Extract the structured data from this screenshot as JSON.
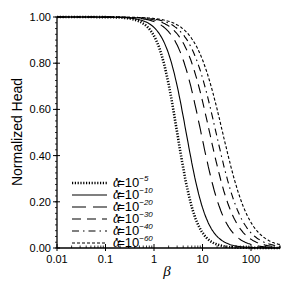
{
  "chart_data": {
    "type": "line",
    "title": "",
    "xlabel": "β",
    "ylabel": "Normalized Head",
    "xscale": "log",
    "xlim": [
      0.01,
      400
    ],
    "ylim": [
      0.0,
      1.0
    ],
    "x_ticks": [
      "0.01",
      "0.1",
      "1",
      "10",
      "100"
    ],
    "y_ticks": [
      "0.00",
      "0.20",
      "0.40",
      "0.60",
      "0.80",
      "1.00"
    ],
    "grid": false,
    "legend_position": "lower left",
    "series": [
      {
        "name": "α*=10^-5",
        "legend_base": "α",
        "legend_eq": "=10",
        "legend_exp": "−5",
        "style": "dotted-thick",
        "beta_half": 3.0
      },
      {
        "name": "α*=10^-10",
        "legend_base": "α",
        "legend_eq": "=10",
        "legend_exp": "−10",
        "style": "solid",
        "beta_half": 4.6
      },
      {
        "name": "α*=10^-20",
        "legend_base": "α",
        "legend_eq": "=10",
        "legend_exp": "−20",
        "style": "long-dash",
        "beta_half": 9.3
      },
      {
        "name": "α*=10^-30",
        "legend_base": "α",
        "legend_eq": "=10",
        "legend_exp": "−30",
        "style": "dash",
        "beta_half": 14
      },
      {
        "name": "α*=10^-40",
        "legend_base": "α",
        "legend_eq": "=10",
        "legend_exp": "−40",
        "style": "dash-dot",
        "beta_half": 19
      },
      {
        "name": "α*=10^-60",
        "legend_base": "α",
        "legend_eq": "=10",
        "legend_exp": "−60",
        "style": "short-dash",
        "beta_half": 26
      }
    ],
    "sample_points": {
      "x": [
        0.01,
        0.1,
        1,
        3,
        10,
        30,
        100,
        300
      ],
      "alpha_1e-5": [
        1.0,
        0.99,
        0.86,
        0.5,
        0.13,
        0.02,
        0.0,
        0.0
      ],
      "alpha_1e-10": [
        1.0,
        0.99,
        0.91,
        0.62,
        0.22,
        0.04,
        0.0,
        0.0
      ],
      "alpha_1e-20": [
        1.0,
        1.0,
        0.95,
        0.8,
        0.47,
        0.12,
        0.01,
        0.0
      ],
      "alpha_1e-30": [
        1.0,
        1.0,
        0.97,
        0.87,
        0.6,
        0.22,
        0.02,
        0.0
      ],
      "alpha_1e-40": [
        1.0,
        1.0,
        0.98,
        0.9,
        0.67,
        0.3,
        0.03,
        0.0
      ],
      "alpha_1e-60": [
        1.0,
        1.0,
        0.99,
        0.93,
        0.75,
        0.4,
        0.06,
        0.0
      ]
    }
  }
}
